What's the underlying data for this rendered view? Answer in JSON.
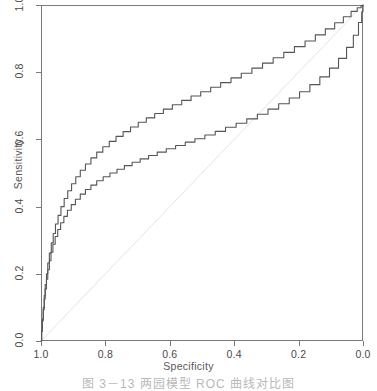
{
  "figure": {
    "caption": "图 3－13   两园模型 ROC 曲线对比图",
    "background_color": "#ffffff"
  },
  "chart_data": {
    "type": "line",
    "title": "",
    "xlabel": "Specificity",
    "ylabel": "Sensitivity",
    "xlim": [
      1.0,
      0.0
    ],
    "ylim": [
      0.0,
      1.0
    ],
    "x_reversed": true,
    "grid": false,
    "legend": null,
    "xticks": [
      1.0,
      0.8,
      0.6,
      0.4,
      0.2,
      0.0
    ],
    "xtick_labels": [
      "1.0",
      "0.8",
      "0.6",
      "0.4",
      "0.2",
      "0.0"
    ],
    "yticks": [
      0.0,
      0.2,
      0.4,
      0.6,
      0.8,
      1.0
    ],
    "ytick_labels": [
      "0.0",
      "0.2",
      "0.4",
      "0.6",
      "0.8",
      "1.0"
    ],
    "curve_color": "#555555",
    "reference_line_color": "#e4e4e4",
    "frame_color": "#7a7a7a",
    "series": [
      {
        "name": "ROC curve 1 (upper)",
        "note": "higher AUC model",
        "points": [
          [
            1.0,
            0.0
          ],
          [
            0.998,
            0.03
          ],
          [
            0.996,
            0.065
          ],
          [
            0.993,
            0.1
          ],
          [
            0.99,
            0.135
          ],
          [
            0.987,
            0.168
          ],
          [
            0.983,
            0.2
          ],
          [
            0.979,
            0.232
          ],
          [
            0.974,
            0.262
          ],
          [
            0.968,
            0.292
          ],
          [
            0.962,
            0.32
          ],
          [
            0.955,
            0.348
          ],
          [
            0.947,
            0.374
          ],
          [
            0.938,
            0.4
          ],
          [
            0.928,
            0.424
          ],
          [
            0.917,
            0.447
          ],
          [
            0.905,
            0.468
          ],
          [
            0.892,
            0.489
          ],
          [
            0.878,
            0.508
          ],
          [
            0.862,
            0.527
          ],
          [
            0.845,
            0.545
          ],
          [
            0.827,
            0.562
          ],
          [
            0.808,
            0.578
          ],
          [
            0.788,
            0.594
          ],
          [
            0.767,
            0.609
          ],
          [
            0.745,
            0.623
          ],
          [
            0.722,
            0.637
          ],
          [
            0.698,
            0.651
          ],
          [
            0.673,
            0.664
          ],
          [
            0.647,
            0.677
          ],
          [
            0.62,
            0.69
          ],
          [
            0.592,
            0.703
          ],
          [
            0.563,
            0.716
          ],
          [
            0.534,
            0.729
          ],
          [
            0.504,
            0.742
          ],
          [
            0.473,
            0.755
          ],
          [
            0.442,
            0.769
          ],
          [
            0.41,
            0.783
          ],
          [
            0.378,
            0.797
          ],
          [
            0.345,
            0.812
          ],
          [
            0.312,
            0.827
          ],
          [
            0.279,
            0.843
          ],
          [
            0.246,
            0.859
          ],
          [
            0.213,
            0.876
          ],
          [
            0.18,
            0.893
          ],
          [
            0.148,
            0.911
          ],
          [
            0.117,
            0.929
          ],
          [
            0.088,
            0.947
          ],
          [
            0.061,
            0.965
          ],
          [
            0.037,
            0.981
          ],
          [
            0.018,
            0.992
          ],
          [
            0.006,
            0.998
          ],
          [
            0.0,
            1.0
          ]
        ]
      },
      {
        "name": "ROC curve 2 (lower)",
        "note": "lower AUC model",
        "points": [
          [
            1.0,
            0.0
          ],
          [
            0.998,
            0.028
          ],
          [
            0.996,
            0.06
          ],
          [
            0.993,
            0.093
          ],
          [
            0.99,
            0.125
          ],
          [
            0.987,
            0.155
          ],
          [
            0.983,
            0.184
          ],
          [
            0.979,
            0.212
          ],
          [
            0.974,
            0.239
          ],
          [
            0.969,
            0.264
          ],
          [
            0.963,
            0.288
          ],
          [
            0.956,
            0.311
          ],
          [
            0.948,
            0.332
          ],
          [
            0.939,
            0.352
          ],
          [
            0.929,
            0.371
          ],
          [
            0.918,
            0.389
          ],
          [
            0.906,
            0.406
          ],
          [
            0.893,
            0.422
          ],
          [
            0.878,
            0.437
          ],
          [
            0.862,
            0.451
          ],
          [
            0.845,
            0.464
          ],
          [
            0.827,
            0.477
          ],
          [
            0.807,
            0.489
          ],
          [
            0.786,
            0.5
          ],
          [
            0.764,
            0.511
          ],
          [
            0.741,
            0.522
          ],
          [
            0.717,
            0.532
          ],
          [
            0.692,
            0.542
          ],
          [
            0.666,
            0.552
          ],
          [
            0.639,
            0.562
          ],
          [
            0.611,
            0.572
          ],
          [
            0.582,
            0.582
          ],
          [
            0.552,
            0.592
          ],
          [
            0.522,
            0.602
          ],
          [
            0.491,
            0.613
          ],
          [
            0.459,
            0.624
          ],
          [
            0.427,
            0.636
          ],
          [
            0.394,
            0.648
          ],
          [
            0.361,
            0.661
          ],
          [
            0.328,
            0.675
          ],
          [
            0.295,
            0.69
          ],
          [
            0.262,
            0.706
          ],
          [
            0.229,
            0.723
          ],
          [
            0.197,
            0.742
          ],
          [
            0.165,
            0.763
          ],
          [
            0.134,
            0.786
          ],
          [
            0.104,
            0.812
          ],
          [
            0.076,
            0.841
          ],
          [
            0.051,
            0.874
          ],
          [
            0.03,
            0.91
          ],
          [
            0.014,
            0.948
          ],
          [
            0.004,
            0.98
          ],
          [
            0.0,
            1.0
          ]
        ]
      }
    ],
    "reference_line": {
      "name": "chance diagonal",
      "points": [
        [
          1.0,
          0.0
        ],
        [
          0.0,
          1.0
        ]
      ]
    }
  }
}
